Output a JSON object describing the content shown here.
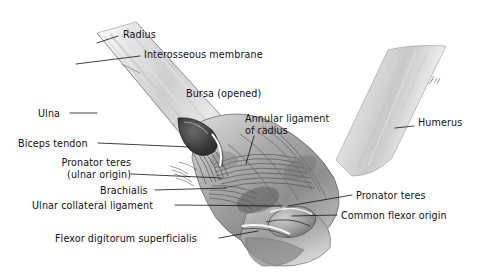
{
  "figure": {
    "background_color": "#ffffff",
    "ink_color": "#111111",
    "width": 483,
    "height": 275
  },
  "labels": [
    {
      "id": "radius",
      "text": "Radius",
      "x": 123,
      "y": 34,
      "align": "left"
    },
    {
      "id": "interosseous-membrane",
      "text": "Interosseous membrane",
      "x": 144,
      "y": 54,
      "align": "left"
    },
    {
      "id": "bursa-opened",
      "text": "Bursa (opened)",
      "x": 186,
      "y": 93,
      "align": "left"
    },
    {
      "id": "annular-ligament-of-radius",
      "text": "Annular ligament",
      "text2": "of radius",
      "x": 245,
      "y": 118,
      "align": "left"
    },
    {
      "id": "humerus",
      "text": "Humerus",
      "x": 418,
      "y": 122,
      "align": "left"
    },
    {
      "id": "ulna",
      "text": "Ulna",
      "x": 38,
      "y": 108,
      "align": "left"
    },
    {
      "id": "biceps-tendon",
      "text": "Biceps tendon",
      "x": 18,
      "y": 139,
      "align": "left"
    },
    {
      "id": "pronator-teres-ulnar-origin",
      "text": "Pronator teres",
      "text2": "(ulnar origin)",
      "x": 41,
      "y": 159,
      "align": "left"
    },
    {
      "id": "brachialis",
      "text": "Brachialis",
      "x": 100,
      "y": 186,
      "align": "left"
    },
    {
      "id": "ulnar-collateral-ligament",
      "text": "Ulnar collateral ligament",
      "x": 32,
      "y": 201,
      "align": "left"
    },
    {
      "id": "pronator-teres",
      "text": "Pronator teres",
      "x": 356,
      "y": 192,
      "align": "left"
    },
    {
      "id": "common-flexor-origin",
      "text": "Common flexor origin",
      "x": 341,
      "y": 212,
      "align": "left"
    },
    {
      "id": "flexor-digitorum-superficialis",
      "text": "Flexor digitorum superficialis",
      "x": 55,
      "y": 234,
      "align": "left"
    }
  ],
  "leader_lines": [
    {
      "id": "leader-radius",
      "from": [
        118,
        38
      ],
      "to": [
        97,
        44
      ]
    },
    {
      "id": "leader-interosseous-membrane",
      "from": [
        140,
        58
      ],
      "to": [
        76,
        64
      ]
    },
    {
      "id": "leader-ulna",
      "from": [
        70,
        113
      ],
      "to": [
        96,
        113
      ]
    },
    {
      "id": "leader-annular-ligament",
      "from": [
        253,
        136
      ],
      "to": [
        247,
        162
      ]
    },
    {
      "id": "leader-humerus",
      "from": [
        414,
        126
      ],
      "to": [
        396,
        128
      ]
    },
    {
      "id": "leader-biceps-tendon",
      "from": [
        98,
        144
      ],
      "to": [
        193,
        148
      ]
    },
    {
      "id": "leader-pronator-teres-ulnar-origin",
      "from": [
        131,
        175
      ],
      "to": [
        224,
        178
      ]
    },
    {
      "id": "leader-brachialis",
      "from": [
        155,
        191
      ],
      "to": [
        226,
        189
      ]
    },
    {
      "id": "leader-ulnar-collateral-ligament",
      "from": [
        175,
        206
      ],
      "to": [
        282,
        207
      ]
    },
    {
      "id": "leader-pronator-teres",
      "from": [
        352,
        196
      ],
      "to": [
        288,
        207
      ]
    },
    {
      "id": "leader-common-flexor-origin",
      "from": [
        337,
        216
      ],
      "to": [
        292,
        217
      ]
    },
    {
      "id": "leader-flexor-digitorum-superficialis",
      "from": [
        219,
        239
      ],
      "to": [
        258,
        231
      ]
    }
  ],
  "structures": [
    {
      "id": "forearm-shaft",
      "name": "forearm (radius and ulna)"
    },
    {
      "id": "humerus-shaft",
      "name": "humerus"
    },
    {
      "id": "elbow-joint-mass",
      "name": "elbow joint soft-tissue mass"
    },
    {
      "id": "interosseous-membrane-fibers",
      "name": "interosseous membrane fiber bundles"
    },
    {
      "id": "biceps-tendon-structure",
      "name": "biceps tendon and bursa"
    },
    {
      "id": "annular-ligament-fibers",
      "name": "annular ligament of radius"
    }
  ]
}
